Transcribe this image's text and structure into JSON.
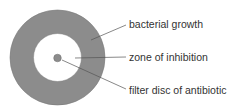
{
  "diagram": {
    "colors": {
      "bacterial_growth": "#8c8c8c",
      "zone": "#ffffff",
      "disc": "#8c8c8c",
      "leader": "#555555",
      "text": "#333333"
    },
    "labels": [
      {
        "id": "bacterial-growth",
        "text": "bacterial growth"
      },
      {
        "id": "zone-of-inhibition",
        "text": "zone of inhibition"
      },
      {
        "id": "filter-disc",
        "text": "filter disc of antibiotic"
      }
    ]
  }
}
